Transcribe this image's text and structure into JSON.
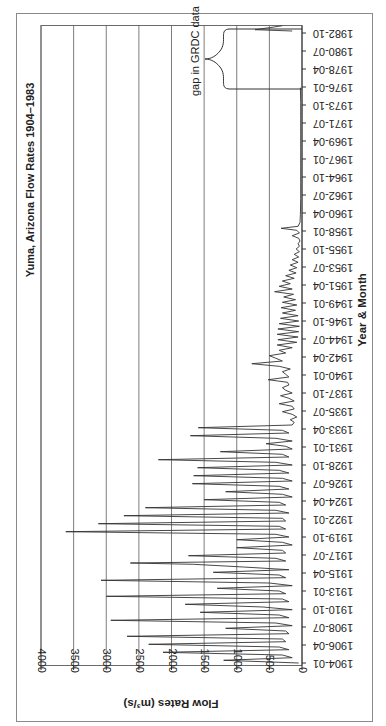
{
  "chart_data": {
    "type": "line",
    "title": "Yuma, Arizona Flow Rates 1904–1983",
    "xlabel": "Year & Month",
    "ylabel": "Flow Rates (m³/s)",
    "ylim": [
      0,
      4000
    ],
    "yticks": [
      0,
      500,
      1000,
      1500,
      2000,
      2500,
      3000,
      3500,
      4000
    ],
    "xticks": [
      "1904-01",
      "1906-04",
      "1908-07",
      "1910-10",
      "1913-01",
      "1915-04",
      "1917-07",
      "1919-10",
      "1922-01",
      "1924-04",
      "1926-07",
      "1928-10",
      "1931-01",
      "1933-04",
      "1935-07",
      "1937-10",
      "1940-01",
      "1942-04",
      "1944-07",
      "1946-10",
      "1949-01",
      "1951-04",
      "1953-07",
      "1955-10",
      "1958-01",
      "1960-04",
      "1962-07",
      "1964-10",
      "1967-01",
      "1969-04",
      "1971-07",
      "1973-10",
      "1976-01",
      "1978-04",
      "1980-07",
      "1982-10"
    ],
    "grid": true,
    "orientation": "rotated 90° (values increase right-to-left, time increases bottom-to-top)",
    "annotations": [
      {
        "text": "gap in GRDC data",
        "span": [
          "1976-01",
          "1983-01"
        ]
      }
    ],
    "series": [
      {
        "name": "Monthly flow",
        "points": [
          [
            "1904-01",
            50
          ],
          [
            "1904-05",
            1200
          ],
          [
            "1904-09",
            150
          ],
          [
            "1905-01",
            300
          ],
          [
            "1905-05",
            2130
          ],
          [
            "1905-09",
            200
          ],
          [
            "1906-01",
            350
          ],
          [
            "1906-05",
            2350
          ],
          [
            "1906-09",
            250
          ],
          [
            "1907-01",
            300
          ],
          [
            "1907-05",
            2680
          ],
          [
            "1907-09",
            200
          ],
          [
            "1908-01",
            250
          ],
          [
            "1908-05",
            1170
          ],
          [
            "1908-09",
            150
          ],
          [
            "1909-01",
            400
          ],
          [
            "1909-05",
            2930
          ],
          [
            "1909-09",
            200
          ],
          [
            "1910-01",
            350
          ],
          [
            "1910-05",
            1560
          ],
          [
            "1910-09",
            150
          ],
          [
            "1911-01",
            600
          ],
          [
            "1911-05",
            1790
          ],
          [
            "1911-09",
            200
          ],
          [
            "1912-01",
            300
          ],
          [
            "1912-05",
            3000
          ],
          [
            "1912-09",
            250
          ],
          [
            "1913-01",
            350
          ],
          [
            "1913-05",
            1300
          ],
          [
            "1913-09",
            150
          ],
          [
            "1914-01",
            500
          ],
          [
            "1914-05",
            3080
          ],
          [
            "1914-09",
            250
          ],
          [
            "1915-01",
            350
          ],
          [
            "1915-05",
            1360
          ],
          [
            "1915-09",
            200
          ],
          [
            "1916-01",
            900
          ],
          [
            "1916-05",
            1660
          ],
          [
            "1916-07",
            2630
          ],
          [
            "1916-10",
            250
          ],
          [
            "1917-02",
            400
          ],
          [
            "1917-06",
            1740
          ],
          [
            "1917-10",
            250
          ],
          [
            "1918-02",
            300
          ],
          [
            "1918-06",
            1000
          ],
          [
            "1918-10",
            150
          ],
          [
            "1919-02",
            300
          ],
          [
            "1919-06",
            1000
          ],
          [
            "1919-10",
            200
          ],
          [
            "1920-02",
            400
          ],
          [
            "1920-06",
            3620
          ],
          [
            "1920-10",
            250
          ],
          [
            "1921-02",
            350
          ],
          [
            "1921-06",
            3120
          ],
          [
            "1921-10",
            250
          ],
          [
            "1922-02",
            300
          ],
          [
            "1922-06",
            2730
          ],
          [
            "1922-10",
            200
          ],
          [
            "1923-02",
            400
          ],
          [
            "1923-06",
            2400
          ],
          [
            "1923-10",
            250
          ],
          [
            "1924-02",
            350
          ],
          [
            "1924-06",
            1500
          ],
          [
            "1924-10",
            150
          ],
          [
            "1925-02",
            300
          ],
          [
            "1925-06",
            1170
          ],
          [
            "1925-10",
            200
          ],
          [
            "1926-02",
            350
          ],
          [
            "1926-06",
            1680
          ],
          [
            "1926-10",
            150
          ],
          [
            "1927-02",
            300
          ],
          [
            "1927-06",
            1660
          ],
          [
            "1927-10",
            200
          ],
          [
            "1928-02",
            350
          ],
          [
            "1928-06",
            1600
          ],
          [
            "1928-10",
            150
          ],
          [
            "1929-02",
            400
          ],
          [
            "1929-06",
            2200
          ],
          [
            "1929-10",
            200
          ],
          [
            "1930-02",
            300
          ],
          [
            "1930-06",
            1250
          ],
          [
            "1930-10",
            150
          ],
          [
            "1931-02",
            250
          ],
          [
            "1931-06",
            550
          ],
          [
            "1931-10",
            150
          ],
          [
            "1932-02",
            400
          ],
          [
            "1932-06",
            1710
          ],
          [
            "1932-10",
            200
          ],
          [
            "1933-02",
            300
          ],
          [
            "1933-06",
            1590
          ],
          [
            "1933-10",
            150
          ],
          [
            "1934-02",
            120
          ],
          [
            "1934-06",
            180
          ],
          [
            "1934-10",
            80
          ],
          [
            "1935-02",
            150
          ],
          [
            "1935-06",
            300
          ],
          [
            "1935-10",
            120
          ],
          [
            "1936-02",
            150
          ],
          [
            "1936-06",
            350
          ],
          [
            "1936-10",
            120
          ],
          [
            "1937-02",
            200
          ],
          [
            "1937-06",
            330
          ],
          [
            "1937-10",
            150
          ],
          [
            "1938-02",
            250
          ],
          [
            "1938-06",
            300
          ],
          [
            "1938-10",
            200
          ],
          [
            "1939-02",
            220
          ],
          [
            "1939-06",
            520
          ],
          [
            "1939-10",
            200
          ],
          [
            "1940-02",
            250
          ],
          [
            "1940-06",
            300
          ],
          [
            "1940-10",
            180
          ],
          [
            "1941-02",
            350
          ],
          [
            "1941-06",
            770
          ],
          [
            "1941-10",
            300
          ],
          [
            "1942-02",
            400
          ],
          [
            "1942-06",
            500
          ],
          [
            "1942-10",
            250
          ],
          [
            "1943-02",
            350
          ],
          [
            "1943-06",
            150
          ],
          [
            "1943-10",
            380
          ],
          [
            "1944-02",
            80
          ],
          [
            "1944-06",
            370
          ],
          [
            "1944-10",
            60
          ],
          [
            "1945-02",
            380
          ],
          [
            "1945-06",
            50
          ],
          [
            "1945-10",
            370
          ],
          [
            "1946-02",
            40
          ],
          [
            "1946-06",
            350
          ],
          [
            "1946-10",
            50
          ],
          [
            "1947-02",
            330
          ],
          [
            "1947-06",
            60
          ],
          [
            "1947-10",
            300
          ],
          [
            "1948-02",
            100
          ],
          [
            "1948-06",
            320
          ],
          [
            "1948-10",
            80
          ],
          [
            "1949-02",
            300
          ],
          [
            "1949-06",
            100
          ],
          [
            "1949-10",
            280
          ],
          [
            "1950-02",
            130
          ],
          [
            "1950-06",
            420
          ],
          [
            "1950-10",
            150
          ],
          [
            "1951-02",
            350
          ],
          [
            "1951-06",
            180
          ],
          [
            "1951-10",
            300
          ],
          [
            "1952-02",
            120
          ],
          [
            "1952-06",
            250
          ],
          [
            "1952-10",
            90
          ],
          [
            "1953-02",
            200
          ],
          [
            "1953-06",
            80
          ],
          [
            "1953-10",
            180
          ],
          [
            "1954-02",
            60
          ],
          [
            "1954-06",
            150
          ],
          [
            "1954-10",
            50
          ],
          [
            "1955-02",
            120
          ],
          [
            "1955-06",
            40
          ],
          [
            "1955-10",
            90
          ],
          [
            "1956-02",
            40
          ],
          [
            "1956-06",
            60
          ],
          [
            "1956-10",
            30
          ],
          [
            "1957-02",
            50
          ],
          [
            "1957-06",
            150
          ],
          [
            "1957-10",
            40
          ],
          [
            "1958-02",
            80
          ],
          [
            "1958-05",
            320
          ],
          [
            "1958-08",
            60
          ],
          [
            "1959-02",
            30
          ],
          [
            "1960-02",
            25
          ],
          [
            "1962-02",
            20
          ],
          [
            "1964-02",
            20
          ],
          [
            "1966-02",
            20
          ],
          [
            "1968-02",
            20
          ],
          [
            "1970-02",
            20
          ],
          [
            "1972-02",
            20
          ],
          [
            "1974-02",
            20
          ],
          [
            "1975-12",
            25
          ],
          [
            "1983-01",
            150
          ],
          [
            "1983-03",
            720
          ],
          [
            "1983-06",
            500
          ],
          [
            "1983-09",
            300
          ]
        ]
      }
    ]
  }
}
